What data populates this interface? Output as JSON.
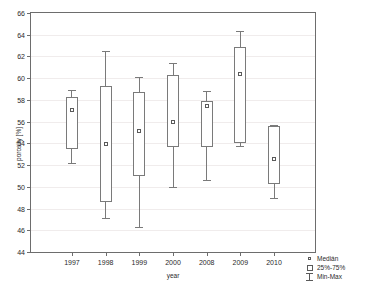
{
  "chart_data": {
    "type": "box",
    "title": "",
    "xlabel": "year",
    "ylabel": "porosity [%]",
    "categories": [
      "1997",
      "1998",
      "1999",
      "2000",
      "2008",
      "2009",
      "2010"
    ],
    "ylim": [
      44,
      66
    ],
    "ytick_step": 2,
    "yticks": [
      44,
      46,
      48,
      50,
      52,
      54,
      56,
      58,
      60,
      62,
      64,
      66
    ],
    "grid": true,
    "legend_position": "bottom-right",
    "boxes": [
      {
        "category": "1997",
        "min": 52.2,
        "q1": 53.5,
        "median": 57.1,
        "q3": 58.3,
        "max": 58.9
      },
      {
        "category": "1998",
        "min": 47.1,
        "q1": 48.6,
        "median": 53.9,
        "q3": 59.3,
        "max": 62.5
      },
      {
        "category": "1999",
        "min": 46.3,
        "q1": 51.0,
        "median": 55.1,
        "q3": 58.7,
        "max": 60.1
      },
      {
        "category": "2000",
        "min": 50.0,
        "q1": 53.7,
        "median": 56.0,
        "q3": 60.3,
        "max": 61.4
      },
      {
        "category": "2008",
        "min": 50.6,
        "q1": 53.7,
        "median": 57.4,
        "q3": 57.9,
        "max": 58.8
      },
      {
        "category": "2009",
        "min": 53.8,
        "q1": 54.0,
        "median": 60.35,
        "q3": 62.9,
        "max": 64.3
      },
      {
        "category": "2010",
        "min": 49.0,
        "q1": 50.3,
        "median": 52.55,
        "q3": 55.6,
        "max": 55.7
      }
    ]
  },
  "legend": {
    "items": [
      {
        "symbol": "median-marker",
        "label": "Medián"
      },
      {
        "symbol": "box-marker",
        "label": "25%-75%"
      },
      {
        "symbol": "minmax-marker",
        "label": "Min-Max"
      }
    ]
  },
  "colors": {
    "axis": "#6d6d6d",
    "line": "#7a7a7a",
    "grid": "#f0ecec",
    "text": "#2a2a2a",
    "background": "#ffffff"
  }
}
